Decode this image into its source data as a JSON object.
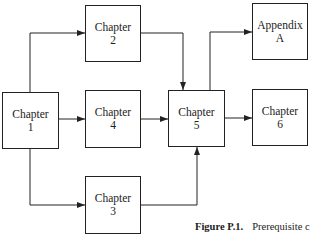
{
  "figure": {
    "caption_label": "Figure P.1.",
    "caption_text": "Prerequisite c"
  },
  "nodes": [
    {
      "id": "ch1",
      "line1": "Chapter",
      "line2": "1"
    },
    {
      "id": "ch2",
      "line1": "Chapter",
      "line2": "2"
    },
    {
      "id": "ch3",
      "line1": "Chapter",
      "line2": "3"
    },
    {
      "id": "ch4",
      "line1": "Chapter",
      "line2": "4"
    },
    {
      "id": "ch5",
      "line1": "Chapter",
      "line2": "5"
    },
    {
      "id": "ch6",
      "line1": "Chapter",
      "line2": "6"
    },
    {
      "id": "appA",
      "line1": "Appendix",
      "line2": "A"
    }
  ],
  "edges": [
    {
      "from": "ch1",
      "to": "ch2"
    },
    {
      "from": "ch1",
      "to": "ch4"
    },
    {
      "from": "ch1",
      "to": "ch3"
    },
    {
      "from": "ch2",
      "to": "ch5"
    },
    {
      "from": "ch4",
      "to": "ch5"
    },
    {
      "from": "ch3",
      "to": "ch5"
    },
    {
      "from": "ch5",
      "to": "appA"
    },
    {
      "from": "ch5",
      "to": "ch6"
    }
  ]
}
